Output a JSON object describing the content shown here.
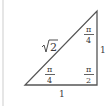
{
  "diagram": {
    "type": "right-triangle",
    "hypotenuse_label": "√2",
    "base_label": "1",
    "height_label": "1",
    "angles": {
      "bottom_left": {
        "numerator": "π",
        "denominator": "4"
      },
      "top_right": {
        "numerator": "π",
        "denominator": "4"
      },
      "bottom_right": {
        "numerator": "π",
        "denominator": "2"
      }
    },
    "line_color": "#555555"
  }
}
